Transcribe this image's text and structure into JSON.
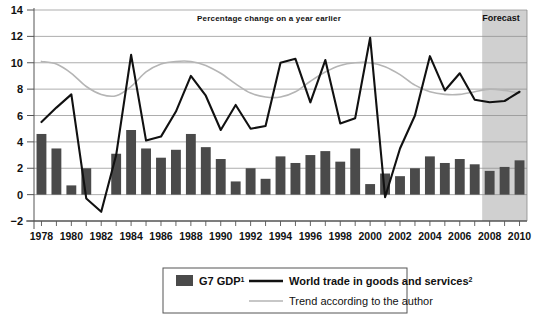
{
  "chart_data": {
    "type": "bar",
    "title": "Percentage change on a year earlier",
    "xlabel": "",
    "ylabel": "",
    "ylim": [
      -2,
      14
    ],
    "yticks": [
      -2,
      0,
      2,
      4,
      6,
      8,
      10,
      12,
      14
    ],
    "ytick_labels": [
      "−2",
      "0",
      "2",
      "4",
      "6",
      "8",
      "10",
      "12",
      "14"
    ],
    "grid": true,
    "legend_position": "below-plot",
    "x": [
      1978,
      1979,
      1980,
      1981,
      1982,
      1983,
      1984,
      1985,
      1986,
      1987,
      1988,
      1989,
      1990,
      1991,
      1992,
      1993,
      1994,
      1995,
      1996,
      1997,
      1998,
      1999,
      2000,
      2001,
      2002,
      2003,
      2004,
      2005,
      2006,
      2007,
      2008,
      2009,
      2010
    ],
    "xtick_labels": [
      "1978",
      "1980",
      "1982",
      "1984",
      "1986",
      "1988",
      "1990",
      "1992",
      "1994",
      "1996",
      "1998",
      "2000",
      "2002",
      "2004",
      "2006",
      "2008",
      "2010"
    ],
    "xtick_years": [
      1978,
      1980,
      1982,
      1984,
      1986,
      1988,
      1990,
      1992,
      1994,
      1996,
      1998,
      2000,
      2002,
      2004,
      2006,
      2008,
      2010
    ],
    "series": [
      {
        "name": "G7 GDP",
        "name_superscript": "1",
        "type": "bar",
        "color": "#4a4a4a",
        "values": [
          4.6,
          3.5,
          0.7,
          2.0,
          0.0,
          3.1,
          4.9,
          3.5,
          2.8,
          3.4,
          4.6,
          3.6,
          2.7,
          1.0,
          2.0,
          1.2,
          2.9,
          2.4,
          3.0,
          3.3,
          2.5,
          3.5,
          0.8,
          1.6,
          1.4,
          2.0,
          2.9,
          2.4,
          2.7,
          2.3,
          1.8,
          2.1,
          2.6
        ]
      },
      {
        "name": "World trade in goods and services",
        "name_superscript": "2",
        "type": "line",
        "color": "#111111",
        "values": [
          5.5,
          6.6,
          7.6,
          -0.3,
          -1.3,
          3.0,
          10.6,
          4.1,
          4.4,
          6.3,
          9.0,
          7.5,
          4.9,
          6.8,
          5.0,
          5.2,
          10.0,
          10.3,
          7.0,
          10.2,
          5.4,
          5.8,
          11.9,
          -0.2,
          3.5,
          6.0,
          10.5,
          7.9,
          9.2,
          7.2,
          7.0,
          7.1,
          7.8
        ]
      },
      {
        "name": "Trend according to the author",
        "type": "line",
        "color": "#b5b5b5",
        "values": [
          10.1,
          9.9,
          9.2,
          8.2,
          7.6,
          7.5,
          8.2,
          9.3,
          9.9,
          10.1,
          10.1,
          9.8,
          9.2,
          8.4,
          7.7,
          7.4,
          7.4,
          7.8,
          8.6,
          9.3,
          9.8,
          10.0,
          10.0,
          9.7,
          9.1,
          8.3,
          7.8,
          7.6,
          7.6,
          7.8,
          8.0,
          7.9,
          7.7
        ]
      }
    ],
    "annotations": [
      {
        "name": "forecast-band",
        "label": "Forecast",
        "from_year": 2007.5,
        "to_year": 2010.5,
        "fill": "#d0d0d0"
      }
    ]
  },
  "legend": {
    "items": [
      {
        "label": "G7 GDP",
        "superscript": "1",
        "marker": "swatch",
        "color": "#4a4a4a",
        "bold": true
      },
      {
        "label": "World trade in goods and services",
        "superscript": "2",
        "marker": "thick-line",
        "color": "#111111",
        "bold": true
      },
      {
        "label": "Trend according to the author",
        "superscript": "",
        "marker": "thin-line",
        "color": "#b5b5b5",
        "bold": false
      }
    ]
  }
}
